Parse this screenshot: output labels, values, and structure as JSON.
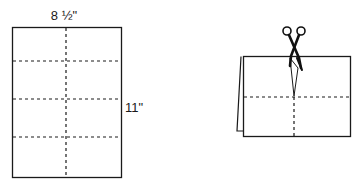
{
  "diagram": {
    "left_figure": {
      "description": "flat sheet of paper with fold lines",
      "width_label": "8 ½\"",
      "height_label": "11\"",
      "fold_lines": {
        "vertical": 1,
        "horizontal": 3
      }
    },
    "right_figure": {
      "description": "folded card with scissors cutting along center fold",
      "icon": "scissors-icon"
    },
    "colors": {
      "line": "#1a1a1a",
      "background": "#ffffff"
    }
  }
}
